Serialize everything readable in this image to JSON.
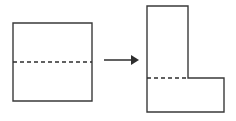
{
  "diagram": {
    "title": "Square transformed into L-shape",
    "caption": "",
    "background_color": "#ffffff",
    "stroke_color": "#3a3a3a",
    "dash_color": "#2e2e2e",
    "arrow_color": "#2e2e2e",
    "stroke_width": 1.4
  },
  "left_figure": {
    "name": "square",
    "label": "Square",
    "x": 13,
    "y": 23,
    "width": 79,
    "height": 78,
    "outline_points": "13,23 92,23 92,101 13,101",
    "dashed_line": {
      "name": "horizontal-fold-line",
      "label": "Dashed horizontal midline",
      "x1": 13,
      "y1": 62,
      "x2": 92,
      "y2": 62,
      "dash_pattern": "4 3"
    }
  },
  "arrow": {
    "name": "transformation-arrow",
    "label": "Arrow pointing right",
    "shaft_x1": 104,
    "shaft_y1": 60,
    "shaft_x2": 132,
    "shaft_y2": 60,
    "head_points": "131,55 139,60 131,65",
    "direction": "right"
  },
  "right_figure": {
    "name": "l-shape",
    "label": "L-shape",
    "outline_points": "147,6 188,6 188,78 224,78 224,112 147,112",
    "vertical_part": {
      "name": "vertical-rectangle",
      "label": "Upper vertical rectangle",
      "x": 147,
      "y": 6,
      "width": 41,
      "height": 72
    },
    "horizontal_part": {
      "name": "horizontal-rectangle",
      "label": "Lower horizontal rectangle",
      "x": 147,
      "y": 78,
      "width": 77,
      "height": 34
    },
    "dashed_line": {
      "name": "horizontal-fold-line",
      "label": "Dashed horizontal division line",
      "x1": 147,
      "y1": 78,
      "x2": 188,
      "y2": 78,
      "dash_pattern": "4 3"
    }
  }
}
